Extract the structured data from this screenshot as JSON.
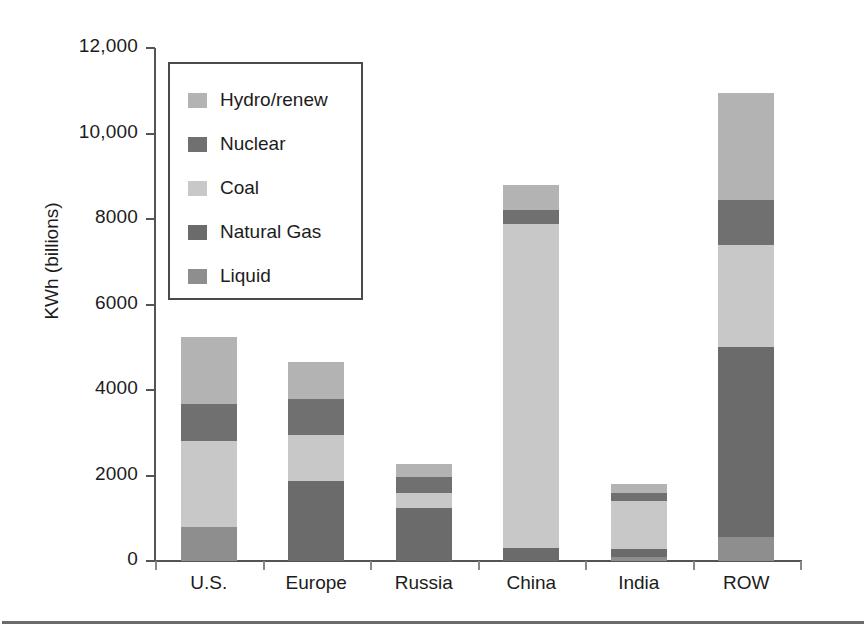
{
  "chart_data": {
    "type": "bar",
    "subtype": "stacked-vertical",
    "title": "",
    "xlabel": "",
    "ylabel": "KWh (billions)",
    "ylim": [
      0,
      12000
    ],
    "ytick_values": [
      0,
      2000,
      4000,
      6000,
      8000,
      10000,
      12000
    ],
    "ytick_labels": [
      "0",
      "2000",
      "4000",
      "6000",
      "8000",
      "10,000",
      "12,000"
    ],
    "grid": false,
    "legend_position": "upper-left-inside",
    "categories": [
      "U.S.",
      "Europe",
      "Russia",
      "China",
      "India",
      "ROW"
    ],
    "series": [
      {
        "name": "Liquid",
        "color": "#8e8e8e",
        "values": [
          800,
          0,
          0,
          0,
          100,
          560
        ]
      },
      {
        "name": "Natural Gas",
        "color": "#6b6b6b",
        "values": [
          0,
          1880,
          1240,
          300,
          170,
          4440
        ]
      },
      {
        "name": "Coal",
        "color": "#c8c8c8",
        "values": [
          2000,
          1070,
          350,
          7580,
          1130,
          2400
        ]
      },
      {
        "name": "Nuclear",
        "color": "#707070",
        "values": [
          880,
          850,
          370,
          320,
          180,
          1050
        ]
      },
      {
        "name": "Hydro/renew",
        "color": "#b3b3b3",
        "values": [
          1570,
          850,
          320,
          600,
          220,
          2500
        ]
      }
    ],
    "totals": [
      5250,
      4650,
      2280,
      8800,
      1800,
      10950
    ],
    "annotations": []
  },
  "legend": {
    "items": [
      {
        "label": "Hydro/renew",
        "color": "#b3b3b3"
      },
      {
        "label": "Nuclear",
        "color": "#707070"
      },
      {
        "label": "Coal",
        "color": "#c8c8c8"
      },
      {
        "label": "Natural Gas",
        "color": "#6b6b6b"
      },
      {
        "label": "Liquid",
        "color": "#8e8e8e"
      }
    ]
  },
  "axes": {
    "y_title": "KWh (billions)"
  },
  "colors": {
    "axis": "#545454",
    "text": "#1c1c1c",
    "legend_border": "#4a4a4a",
    "rule": "#6b6b6b",
    "background": "#ffffff"
  }
}
